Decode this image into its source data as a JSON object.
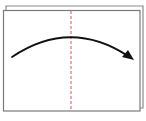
{
  "diagram": {
    "type": "origami-fold-instruction",
    "back_sheet": {
      "x": 6,
      "y": 6,
      "width": 137,
      "height": 102,
      "stroke": "#8a8a8a"
    },
    "front_sheet": {
      "x": 3,
      "y": 10,
      "width": 137,
      "height": 101,
      "stroke": "#7a7a7a",
      "fill": "#ffffff"
    },
    "fold_line": {
      "x": 71,
      "y1": 10,
      "y2": 111,
      "style": "dashed",
      "color": "#e0404a"
    },
    "arrow": {
      "direction": "left-to-right",
      "start": [
        12,
        57
      ],
      "control": [
        70,
        18
      ],
      "end": [
        132,
        59
      ],
      "color": "#111111"
    }
  }
}
